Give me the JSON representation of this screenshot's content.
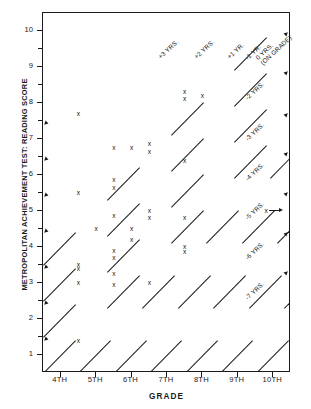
{
  "chart_data": {
    "type": "scatter",
    "title": "",
    "xlabel": "GRADE",
    "ylabel": "METROPOLITAN ACHIEVEMENT TEST: READING SCORE",
    "xlim": [
      3.5,
      10.5
    ],
    "ylim": [
      0.5,
      10.5
    ],
    "grid": false,
    "legend_position": "none",
    "x_tick_labels": [
      "4TH",
      "5TH",
      "6TH",
      "7TH",
      "8TH",
      "9TH",
      "10TH"
    ],
    "x_tick_values": [
      4,
      5,
      6,
      7,
      8,
      9,
      10
    ],
    "y_tick_labels": [
      "1",
      "2",
      "3",
      "4",
      "5",
      "6",
      "7",
      "8",
      "9",
      "10"
    ],
    "y_tick_values": [
      1,
      2,
      3,
      4,
      5,
      6,
      7,
      8,
      9,
      10
    ],
    "y_minor_ticks": [
      1.5,
      2.5,
      3.5,
      4.5,
      5.5,
      6.5,
      7.5,
      8.5,
      9.5
    ],
    "marker": "x",
    "points": [
      {
        "x": 4.5,
        "y": 7.7
      },
      {
        "x": 4.5,
        "y": 5.5
      },
      {
        "x": 4.5,
        "y": 3.5
      },
      {
        "x": 4.5,
        "y": 3.4
      },
      {
        "x": 4.5,
        "y": 3.0
      },
      {
        "x": 4.5,
        "y": 1.4
      },
      {
        "x": 5.0,
        "y": 4.5
      },
      {
        "x": 5.5,
        "y": 6.75
      },
      {
        "x": 5.5,
        "y": 5.85
      },
      {
        "x": 5.5,
        "y": 5.65
      },
      {
        "x": 5.5,
        "y": 4.85
      },
      {
        "x": 5.5,
        "y": 3.9
      },
      {
        "x": 5.5,
        "y": 3.7
      },
      {
        "x": 5.5,
        "y": 3.25
      },
      {
        "x": 5.5,
        "y": 2.95
      },
      {
        "x": 6.0,
        "y": 6.75
      },
      {
        "x": 6.0,
        "y": 4.5
      },
      {
        "x": 6.0,
        "y": 4.2
      },
      {
        "x": 6.5,
        "y": 6.85
      },
      {
        "x": 6.5,
        "y": 6.65
      },
      {
        "x": 6.5,
        "y": 5.0
      },
      {
        "x": 6.5,
        "y": 4.8
      },
      {
        "x": 6.5,
        "y": 3.0
      },
      {
        "x": 7.5,
        "y": 8.3
      },
      {
        "x": 7.5,
        "y": 8.1
      },
      {
        "x": 7.5,
        "y": 6.4
      },
      {
        "x": 7.5,
        "y": 4.8
      },
      {
        "x": 7.5,
        "y": 4.0
      },
      {
        "x": 7.5,
        "y": 3.85
      },
      {
        "x": 8.0,
        "y": 8.2
      },
      {
        "x": 9.8,
        "y": 5.0
      }
    ],
    "reference_lines": {
      "description": "Diagonal iso-lines showing years above or below grade level",
      "slope_note": "one grade level per reading-score unit",
      "labels": [
        "+3 YRS.",
        "+2 YRS.",
        "+1 YR.",
        "0 YRS. (ON GRADE)",
        "-1 YR.",
        "-2 YRS.",
        "-3 YRS.",
        "-4 YRS.",
        "-5 YRS.",
        "-6 YRS.",
        "-7 YRS."
      ],
      "top_labels": [
        "+3 YRS.",
        "+2 YRS.",
        "+1 YR.",
        "0 YRS.",
        "(ON GRADE)"
      ],
      "right_labels": [
        "-1 YR.",
        "-2 YRS.",
        "-3 YRS.",
        "-4 YRS.",
        "-5 YRS.",
        "-6 YRS.",
        "-7 YRS."
      ],
      "offsets": [
        3,
        2,
        1,
        0,
        -1,
        -2,
        -3,
        -4,
        -5,
        -6,
        -7
      ]
    },
    "annotation": {
      "text": "",
      "marker": "x",
      "points_to": {
        "x": 9.8,
        "y": 5.0
      }
    }
  },
  "axis": {
    "y_title": "METROPOLITAN ACHIEVEMENT TEST: READING SCORE",
    "x_title": "GRADE"
  },
  "colors": {
    "axis": "#1a1a1a",
    "marker": "#111111",
    "background": "#ffffff"
  }
}
